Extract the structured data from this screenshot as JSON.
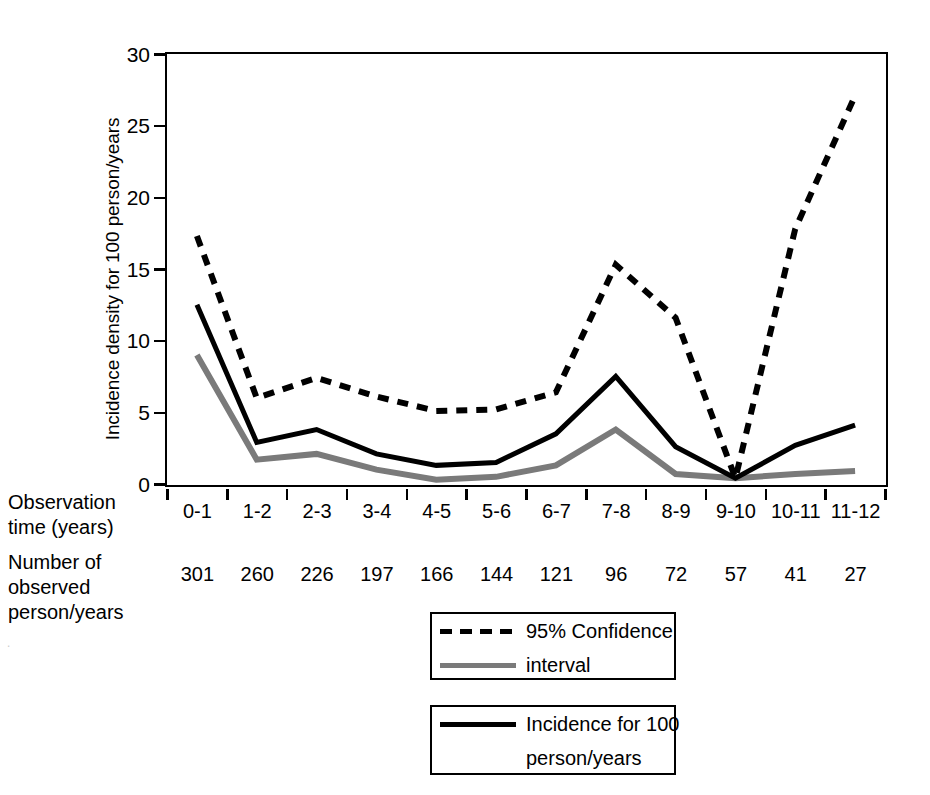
{
  "chart_data": {
    "type": "line",
    "title": "",
    "xlabel": "Observation time (years)",
    "ylabel": "Incidence density for 100 person/years",
    "categories": [
      "0-1",
      "1-2",
      "2-3",
      "3-4",
      "4-5",
      "5-6",
      "6-7",
      "7-8",
      "8-9",
      "9-10",
      "10-11",
      "11-12"
    ],
    "ylim": [
      0,
      30
    ],
    "yticks": [
      0,
      5,
      10,
      15,
      20,
      25,
      30
    ],
    "grid": false,
    "legend_position": "bottom-center",
    "series": [
      {
        "name": "95% Confidence interval upper",
        "style": "dashed",
        "color": "#000000",
        "values": [
          17.3,
          6.0,
          7.4,
          6.1,
          5.1,
          5.2,
          6.4,
          15.3,
          11.6,
          0.4,
          17.8,
          27.1
        ]
      },
      {
        "name": "Incidence for 100 person/years",
        "style": "solid",
        "color": "#000000",
        "values": [
          12.5,
          2.9,
          3.8,
          2.1,
          1.3,
          1.5,
          3.5,
          7.5,
          2.6,
          0.4,
          2.7,
          4.1
        ]
      },
      {
        "name": "95% Confidence interval lower",
        "style": "solid",
        "color": "#7a7a7a",
        "values": [
          9.0,
          1.7,
          2.1,
          1.0,
          0.3,
          0.5,
          1.3,
          3.8,
          0.7,
          0.4,
          0.7,
          0.9
        ]
      }
    ],
    "secondary_axis": {
      "label": "Number of observed person/years",
      "values": [
        301,
        260,
        226,
        197,
        166,
        144,
        121,
        96,
        72,
        57,
        41,
        27
      ]
    }
  },
  "axes": {
    "y_title": "Incidence density for 100 person/years",
    "y_tick_labels": [
      "30",
      "25",
      "20",
      "15",
      "10",
      "5",
      "0"
    ]
  },
  "row_labels": {
    "observation_time": [
      "Observation",
      "time (years)"
    ],
    "number_observed": [
      "Number of",
      "observed",
      "person/years"
    ]
  },
  "legend": {
    "ci": {
      "line1": "95% Confidence",
      "line2": "interval",
      "dashed_swatch": "dashed-black-line-icon",
      "gray_swatch": "solid-gray-line-icon"
    },
    "incidence": {
      "line1": "Incidence for 100",
      "line2": "person/years",
      "solid_swatch": "solid-black-line-icon"
    }
  },
  "artifact": {
    "text": "·"
  },
  "colors": {
    "axis": "#000000",
    "incidence_line": "#000000",
    "ci_upper_line": "#000000",
    "ci_lower_line": "#7a7a7a",
    "background": "#ffffff"
  }
}
